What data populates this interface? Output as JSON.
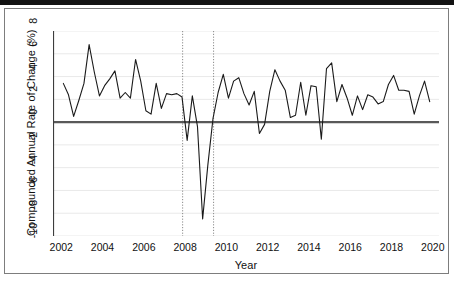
{
  "figure": {
    "y_axis_title": "Compounded Annual Rate of Change (%)",
    "x_axis_title": "Year"
  },
  "chart_data": {
    "type": "line",
    "title": "",
    "xlabel": "Year",
    "ylabel": "Compounded Annual Rate of Change (%)",
    "xlim": [
      2001.6,
      2020.3
    ],
    "ylim": [
      -10,
      8
    ],
    "yticks": [
      -10,
      -8,
      -6,
      -4,
      -2,
      0,
      2,
      4,
      6,
      8
    ],
    "ytick_labels": [
      "-10",
      "-8",
      "-6",
      "-4",
      "-2",
      "0",
      "2",
      "4",
      "6",
      "8"
    ],
    "xticks": [
      2002,
      2004,
      2006,
      2008,
      2010,
      2012,
      2014,
      2016,
      2018,
      2020
    ],
    "xtick_labels": [
      "2002",
      "2004",
      "2006",
      "2008",
      "2010",
      "2012",
      "2014",
      "2016",
      "2018",
      "2020"
    ],
    "grid": "horizontal-only",
    "legend": "none",
    "zero_line": {
      "value": 0,
      "color": "#595959",
      "width": 2.4
    },
    "recession_markers": {
      "style": "dotted-vertical",
      "color": "#8a8a8a",
      "x_values": [
        2007.88,
        2009.38
      ]
    },
    "series": [
      {
        "name": "Compounded Annual Rate of Change",
        "color": "#1a1a1a",
        "width": 1.1,
        "x": [
          2002.1,
          2002.35,
          2002.6,
          2002.85,
          2003.1,
          2003.35,
          2003.6,
          2003.85,
          2004.1,
          2004.35,
          2004.6,
          2004.85,
          2005.1,
          2005.35,
          2005.6,
          2005.85,
          2006.1,
          2006.35,
          2006.6,
          2006.85,
          2007.1,
          2007.35,
          2007.6,
          2007.85,
          2008.1,
          2008.35,
          2008.6,
          2008.85,
          2009.1,
          2009.35,
          2009.6,
          2009.85,
          2010.1,
          2010.35,
          2010.6,
          2010.85,
          2011.1,
          2011.35,
          2011.6,
          2011.85,
          2012.1,
          2012.35,
          2012.6,
          2012.85,
          2013.1,
          2013.35,
          2013.6,
          2013.85,
          2014.1,
          2014.35,
          2014.6,
          2014.85,
          2015.1,
          2015.35,
          2015.6,
          2015.85,
          2016.1,
          2016.35,
          2016.6,
          2016.85,
          2017.1,
          2017.35,
          2017.6,
          2017.85,
          2018.1,
          2018.35,
          2018.6,
          2018.85,
          2019.1,
          2019.35,
          2019.6,
          2019.85
        ],
        "y": [
          3.4,
          2.4,
          0.5,
          1.9,
          3.4,
          6.8,
          4.4,
          2.3,
          3.2,
          3.8,
          4.5,
          2.1,
          2.6,
          2.1,
          5.5,
          3.6,
          1.0,
          0.7,
          3.4,
          1.2,
          2.5,
          2.4,
          2.5,
          2.2,
          -1.6,
          2.3,
          -0.4,
          -8.5,
          -3.8,
          0.3,
          2.6,
          4.2,
          2.1,
          3.6,
          3.9,
          2.5,
          1.5,
          2.7,
          -1.0,
          -0.2,
          2.7,
          4.6,
          3.6,
          2.8,
          0.4,
          0.6,
          3.5,
          0.6,
          3.2,
          3.1,
          -1.5,
          4.7,
          5.2,
          1.8,
          3.3,
          2.1,
          0.6,
          2.3,
          1.1,
          2.4,
          2.2,
          1.6,
          1.8,
          3.3,
          4.1,
          2.8,
          2.8,
          2.7,
          0.7,
          2.3,
          3.6,
          1.8
        ]
      }
    ]
  }
}
